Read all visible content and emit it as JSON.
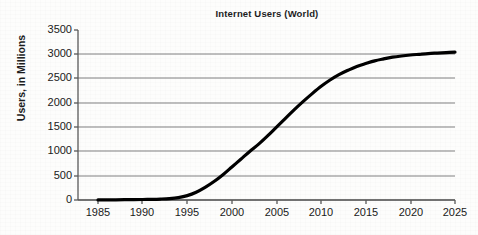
{
  "chart_data": {
    "type": "line",
    "title": "Internet Users (World)",
    "xlabel": "",
    "ylabel": "Users, in Millions",
    "xlim": [
      1983,
      2027
    ],
    "ylim": [
      0,
      3500
    ],
    "xticks": [
      "1985",
      "1990",
      "1995",
      "2000",
      "2005",
      "2010",
      "2015",
      "2020",
      "2025"
    ],
    "yticks": [
      "0",
      "500",
      "1000",
      "1500",
      "2000",
      "2500",
      "3000",
      "3500"
    ],
    "grid": "horizontal",
    "legend": "none",
    "line_color": "#000000",
    "grid_color": "#808080",
    "axis_color": "#595959",
    "background_color": "#fdfdfc",
    "series": [
      {
        "name": "Internet Users (World)",
        "x": [
          1985,
          1986,
          1987,
          1988,
          1989,
          1990,
          1991,
          1992,
          1993,
          1994,
          1995,
          1996,
          1997,
          1998,
          1999,
          2000,
          2001,
          2002,
          2003,
          2004,
          2005,
          2006,
          2007,
          2008,
          2009,
          2010,
          2011,
          2012,
          2013,
          2014,
          2015,
          2016,
          2017,
          2018,
          2019,
          2020,
          2021,
          2022,
          2023,
          2024,
          2025
        ],
        "values": [
          2,
          3,
          4,
          6,
          8,
          10,
          14,
          20,
          30,
          50,
          90,
          160,
          260,
          380,
          520,
          680,
          840,
          1000,
          1150,
          1320,
          1500,
          1680,
          1860,
          2030,
          2190,
          2340,
          2470,
          2580,
          2670,
          2750,
          2810,
          2865,
          2905,
          2940,
          2965,
          2985,
          3000,
          3015,
          3025,
          3035,
          3045
        ]
      }
    ]
  },
  "ytick_positions": [
    {
      "label": "3500",
      "y": 30
    },
    {
      "label": "3000",
      "y": 54
    },
    {
      "label": "2500",
      "y": 78
    },
    {
      "label": "2000",
      "y": 103
    },
    {
      "label": "1500",
      "y": 127
    },
    {
      "label": "1000",
      "y": 151
    },
    {
      "label": "500",
      "y": 176
    },
    {
      "label": "0",
      "y": 200
    }
  ],
  "xtick_positions": [
    {
      "label": "1985",
      "x": 98
    },
    {
      "label": "1990",
      "x": 142
    },
    {
      "label": "1995",
      "x": 187
    },
    {
      "label": "2000",
      "x": 232
    },
    {
      "label": "2005",
      "x": 277
    },
    {
      "label": "2010",
      "x": 321
    },
    {
      "label": "2015",
      "x": 366
    },
    {
      "label": "2020",
      "x": 411
    },
    {
      "label": "2025",
      "x": 455
    }
  ]
}
